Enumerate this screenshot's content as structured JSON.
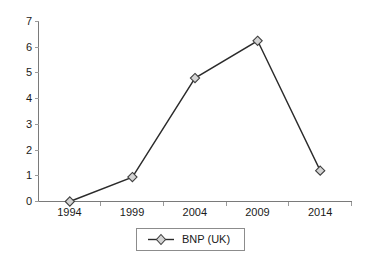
{
  "chart_data": {
    "type": "line",
    "title": "",
    "subtitle": "",
    "xlabel": "",
    "ylabel": "",
    "categories": [
      "1994",
      "1999",
      "2004",
      "2009",
      "2014"
    ],
    "series": [
      {
        "name": "BNP (UK)",
        "values": [
          0,
          0.95,
          4.8,
          6.25,
          1.2
        ],
        "marker": "diamond",
        "marker_fill": "#d4d4d4",
        "marker_stroke": "#404040",
        "line_color": "#2b2b2b"
      }
    ],
    "ylim": [
      0,
      7
    ],
    "yticks": [
      "0",
      "1",
      "2",
      "3",
      "4",
      "5",
      "6",
      "7"
    ],
    "xticks": [
      "1994",
      "1999",
      "2004",
      "2009",
      "2014"
    ],
    "grid": false,
    "legend_position": "bottom-center",
    "legend_entries": [
      "BNP (UK)"
    ],
    "annotations": []
  },
  "legend": {
    "label": "BNP (UK)"
  },
  "axes": {
    "y_tick_labels": [
      "7",
      "6",
      "5",
      "4",
      "3",
      "2",
      "1",
      "0"
    ],
    "x_tick_labels": [
      "1994",
      "1999",
      "2004",
      "2009",
      "2014"
    ]
  },
  "colors": {
    "background": "#ffffff",
    "axis": "#7a7a7a",
    "tick": "#9a9a9a",
    "line": "#2b2b2b",
    "marker_fill": "#d4d4d4",
    "marker_stroke": "#404040",
    "text": "#1a1a1a",
    "legend_border": "#8c8c8c"
  }
}
